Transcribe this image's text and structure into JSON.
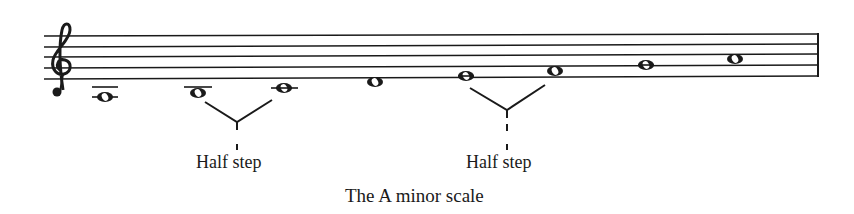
{
  "figure": {
    "caption": "The A minor scale",
    "clef": "treble-clef",
    "notes": [
      {
        "name": "A",
        "x": 105,
        "y": 97,
        "ledger_lines": [
          87,
          97
        ]
      },
      {
        "name": "B",
        "x": 198,
        "y": 93,
        "ledger_lines": [
          87
        ]
      },
      {
        "name": "C",
        "x": 284,
        "y": 88,
        "ledger_lines": [
          88
        ]
      },
      {
        "name": "D",
        "x": 375,
        "y": 82,
        "ledger_lines": []
      },
      {
        "name": "E",
        "x": 466,
        "y": 76,
        "ledger_lines": []
      },
      {
        "name": "F",
        "x": 555,
        "y": 71,
        "ledger_lines": []
      },
      {
        "name": "G",
        "x": 646,
        "y": 65,
        "ledger_lines": []
      },
      {
        "name": "A",
        "x": 735,
        "y": 59,
        "ledger_lines": []
      }
    ],
    "annotations": [
      {
        "label": "Half step",
        "between": [
          "B",
          "C"
        ],
        "label_x": 196
      },
      {
        "label": "Half step",
        "between": [
          "E",
          "F"
        ],
        "label_x": 466
      }
    ]
  },
  "colors": {
    "ink": "#1a1a1a",
    "background": "#ffffff"
  }
}
